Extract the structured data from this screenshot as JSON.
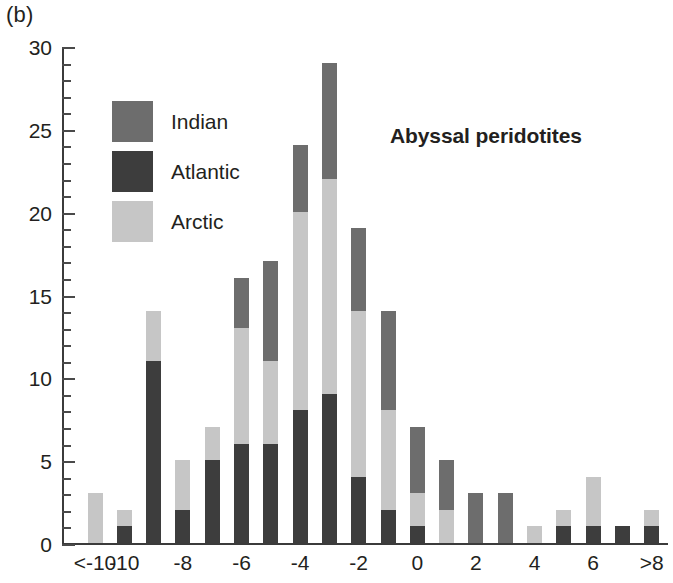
{
  "panel_label": "(b)",
  "chart_data": {
    "type": "bar",
    "subtype": "stacked-bar-histogram",
    "title": "Abyssal peridotites",
    "xlabel": "",
    "ylabel": "",
    "ylim": [
      0,
      30
    ],
    "ytick_interval": 5,
    "yminor_tick_interval": 1,
    "grid": false,
    "legend_position": "upper-left-inside",
    "stack_order_bottom_to_top": [
      "Atlantic",
      "Arctic",
      "Indian"
    ],
    "x": [
      -11,
      -10,
      -9,
      -8,
      -7,
      -6,
      -5,
      -4,
      -3,
      -2,
      -1,
      0,
      1,
      2,
      3,
      4,
      5,
      6,
      7,
      9
    ],
    "categories": [
      "<-10",
      "-10",
      "-9",
      "-8",
      "-7",
      "-6",
      "-5",
      "-4",
      "-3",
      "-2",
      "-1",
      "0",
      "1",
      "2",
      "3",
      "4",
      "5",
      "6",
      "7",
      ">8"
    ],
    "xtick_labels": [
      "<-10",
      "-10",
      "-8",
      "-6",
      "-4",
      "-2",
      "0",
      "2",
      "4",
      "6",
      ">8"
    ],
    "xtick_values": [
      -11,
      -10,
      -8,
      -6,
      -4,
      -2,
      0,
      2,
      4,
      6,
      9
    ],
    "yticks": [
      0,
      5,
      10,
      15,
      20,
      25,
      30
    ],
    "series": [
      {
        "name": "Indian",
        "color": "#6d6d6d",
        "values": [
          0,
          0,
          0,
          0,
          0,
          3,
          6,
          4,
          7,
          5,
          6,
          4,
          3,
          3,
          3,
          0,
          0,
          0,
          0,
          0
        ]
      },
      {
        "name": "Atlantic",
        "color": "#3d3d3d",
        "values": [
          0,
          1,
          11,
          2,
          5,
          6,
          6,
          8,
          9,
          4,
          2,
          1,
          0,
          0,
          0,
          0,
          1,
          1,
          1,
          1
        ]
      },
      {
        "name": "Arctic",
        "color": "#c6c6c6",
        "values": [
          3,
          1,
          3,
          3,
          2,
          7,
          5,
          12,
          13,
          10,
          6,
          2,
          2,
          0,
          0,
          1,
          1,
          3,
          0,
          1
        ]
      }
    ],
    "totals": [
      3,
      2,
      14,
      5,
      7,
      16,
      17,
      24,
      29,
      19,
      14,
      7,
      5,
      3,
      3,
      1,
      2,
      4,
      1,
      2
    ]
  },
  "legend": {
    "items": [
      {
        "label": "Indian",
        "color": "#6d6d6d"
      },
      {
        "label": "Atlantic",
        "color": "#3d3d3d"
      },
      {
        "label": "Arctic",
        "color": "#c6c6c6"
      }
    ]
  },
  "axis": {
    "line_color": "#3b3b3b",
    "tick_color": "#4a4a4a"
  }
}
